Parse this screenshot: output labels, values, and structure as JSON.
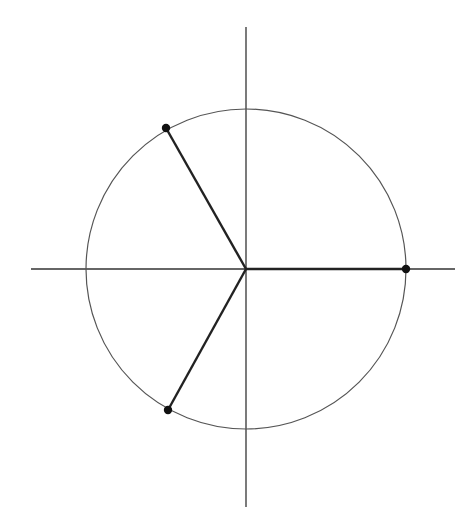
{
  "diagram": {
    "colors": {
      "background": "#ffffff",
      "axis": "#333333",
      "circle": "#555555",
      "radius": "#222222",
      "point": "#111111"
    },
    "center": {
      "x": 246,
      "y": 269
    },
    "radius_px": 160,
    "axes": {
      "horizontal": {
        "x1": 31,
        "x2": 455
      },
      "vertical": {
        "y1": 27,
        "y2": 507
      }
    },
    "points": [
      {
        "name": "point-0deg",
        "angle_deg": 0,
        "x": 406,
        "y": 269
      },
      {
        "name": "point-120deg",
        "angle_deg": 120,
        "x": 166,
        "y": 128
      },
      {
        "name": "point-240deg",
        "angle_deg": 240,
        "x": 168,
        "y": 410
      }
    ]
  }
}
